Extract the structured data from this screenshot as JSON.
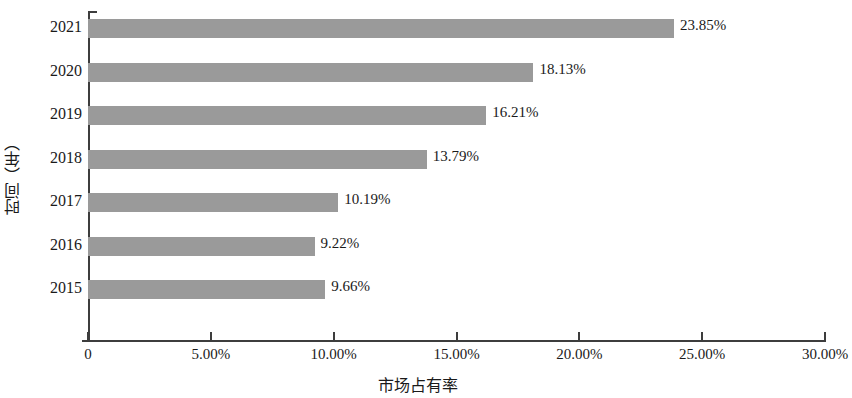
{
  "chart_data": {
    "type": "bar",
    "orientation": "horizontal",
    "title": "",
    "xlabel": "市场占有率",
    "ylabel": "时间（年）",
    "categories": [
      "2021",
      "2020",
      "2019",
      "2018",
      "2017",
      "2016",
      "2015"
    ],
    "values": [
      23.85,
      18.13,
      16.21,
      13.79,
      10.19,
      9.22,
      9.66
    ],
    "data_labels": [
      "23.85%",
      "18.13%",
      "16.21%",
      "13.79%",
      "10.19%",
      "9.22%",
      "9.66%"
    ],
    "xlim": [
      0,
      30
    ],
    "x_ticks": [
      0,
      5,
      10,
      15,
      20,
      25,
      30
    ],
    "x_tick_labels": [
      "0",
      "5.00%",
      "10.00%",
      "15.00%",
      "20.00%",
      "25.00%",
      "30.00%"
    ],
    "grid": false,
    "legend": false,
    "bar_color": "#9a9a9a",
    "axis_color": "#3d3d3d",
    "background_color": "#ffffff"
  }
}
